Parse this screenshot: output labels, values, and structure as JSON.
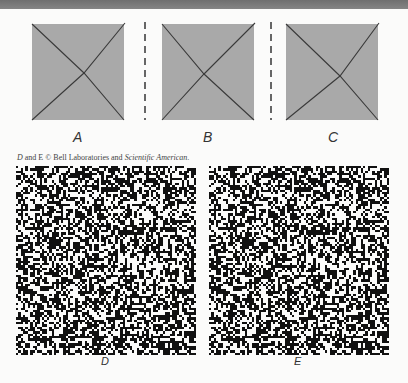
{
  "colors": {
    "top_bar": "#7a7a7a",
    "square_fill": "#a9a9a9",
    "diagonal_line": "#3a3a3a",
    "dot_black": "#111111",
    "dot_white": "#fbfbfa"
  },
  "figures": [
    {
      "label": "A",
      "crossing": {
        "x": 52,
        "y": 49
      }
    },
    {
      "label": "B",
      "crossing": {
        "x": 42,
        "y": 50
      }
    },
    {
      "label": "C",
      "crossing": {
        "x": 54,
        "y": 52
      }
    }
  ],
  "caption": {
    "part1": "D",
    "part2": " and ",
    "part3": "E",
    "part4": " © Bell Laboratories and ",
    "part5": "Scientific American",
    "part6": "."
  },
  "stereograms": {
    "grid_cols": 76,
    "grid_rows": 80,
    "density": 0.52,
    "seed": 1337,
    "shifted_region": {
      "col0": 24,
      "row0": 24,
      "cols": 28,
      "rows": 32,
      "shift": 2
    },
    "items": [
      {
        "label": "D"
      },
      {
        "label": "E"
      }
    ]
  }
}
